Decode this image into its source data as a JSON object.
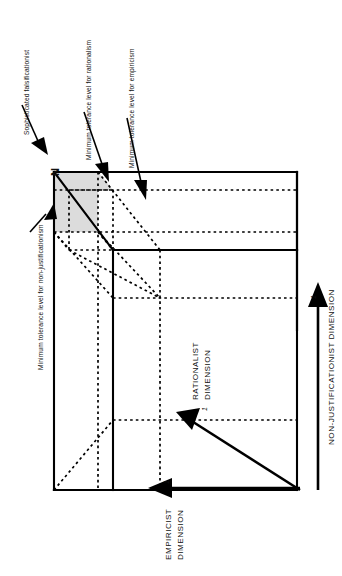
{
  "figure": {
    "orientation": "rotated-90-ccw",
    "background_color": "#ffffff",
    "line_color": "#000000",
    "shade_color": "#d9d9d9",
    "origin_label": "N",
    "annotations": [
      {
        "name": "sophisticated-falsificationist",
        "text": "Sophisticated falsificationist"
      },
      {
        "name": "min-tolerance-rationalism",
        "text": "Minimum tolerance level for rationalism"
      },
      {
        "name": "min-tolerance-empiricism",
        "text": "Minimum tolerance level for empiricism"
      },
      {
        "name": "min-tolerance-non-justificationism",
        "text": "Minimum tolerance level for non-justificationism"
      }
    ],
    "axes": [
      {
        "name": "empiricist-dimension",
        "line1": "EMPIRICIST",
        "line2": "DIMENSION",
        "tick": "1"
      },
      {
        "name": "rationalist-dimension",
        "line1": "RATIONALIST",
        "line2": "DIMENSION",
        "tick": "1"
      },
      {
        "name": "non-justificationist-dimension",
        "line1": "NON-JUSTIFICATIONIST DIMENSION",
        "line2": "",
        "tick": "1"
      }
    ],
    "ticks": {
      "empiricist": "1",
      "rationalist": "1",
      "non_justificationist": "1"
    }
  }
}
